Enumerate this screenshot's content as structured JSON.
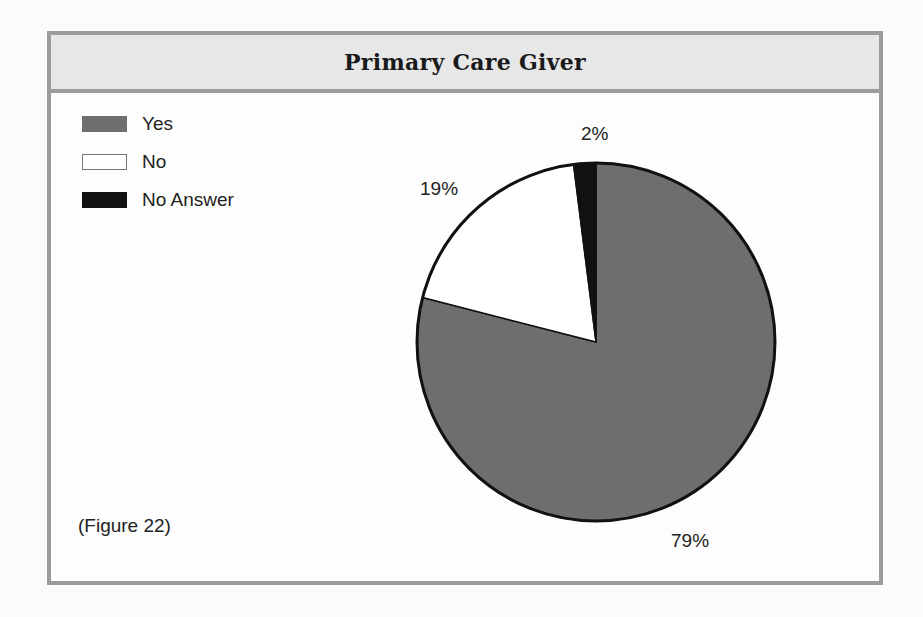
{
  "title": "Primary Care Giver",
  "legend": [
    {
      "label": "Yes",
      "color": "#6e6e6e",
      "border": "#6e6e6e"
    },
    {
      "label": "No",
      "color": "#ffffff",
      "border": "#777777"
    },
    {
      "label": "No Answer",
      "color": "#111111",
      "border": "#111111"
    }
  ],
  "caption": "(Figure 22)",
  "slice_labels": {
    "yes": "79%",
    "no": "19%",
    "no_answer": "2%"
  },
  "chart_data": {
    "type": "pie",
    "title": "Primary Care Giver",
    "categories": [
      "Yes",
      "No",
      "No Answer"
    ],
    "values": [
      79,
      19,
      2
    ],
    "unit": "%",
    "colors": [
      "#6e6e6e",
      "#ffffff",
      "#111111"
    ],
    "data_labels": [
      "79%",
      "19%",
      "2%"
    ],
    "legend_position": "top-left",
    "start_angle": "12 o'clock, clockwise: Yes, then No, then No Answer",
    "annotation": "(Figure 22)"
  }
}
